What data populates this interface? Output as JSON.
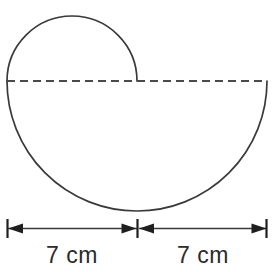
{
  "figure": {
    "type": "geometry-diagram",
    "stroke_color": "#3a3a3a",
    "dash_color": "#4a4a4a",
    "text_color": "#2b2b2b",
    "background_color": "#ffffff",
    "shapes": {
      "upper_semicircle": {
        "name": "small-semicircle",
        "center_x": 72,
        "center_y": 81,
        "radius": 65,
        "half": "upper",
        "style": "solid"
      },
      "lower_semicircle": {
        "name": "large-semicircle",
        "center_x": 137,
        "center_y": 81,
        "radius": 130,
        "half": "lower",
        "style": "solid"
      },
      "diameter_line": {
        "name": "dashed-diameter",
        "x1": 7,
        "y1": 81,
        "x2": 267,
        "y2": 81,
        "style": "dashed",
        "dash_pattern": "8 5"
      }
    },
    "dimensions": [
      {
        "id": "left-dimension",
        "label": "7 cm",
        "value": 7,
        "unit": "cm",
        "x_start": 7,
        "x_end": 137,
        "y": 228,
        "label_x": 72,
        "label_y": 263
      },
      {
        "id": "right-dimension",
        "label": "7 cm",
        "value": 7,
        "unit": "cm",
        "x_start": 138,
        "x_end": 267,
        "y": 228,
        "label_x": 203,
        "label_y": 263
      }
    ]
  }
}
